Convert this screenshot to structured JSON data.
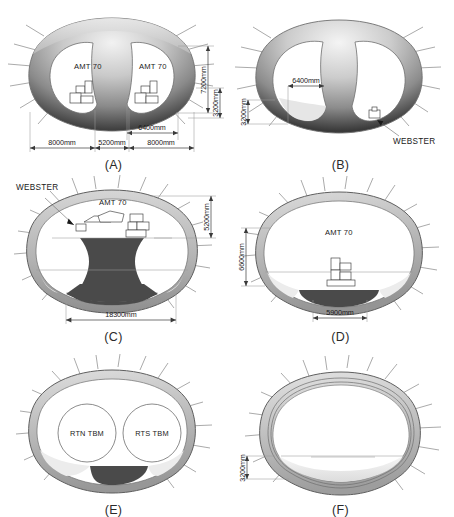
{
  "figure": {
    "title": "",
    "type": "engineering-diagram",
    "panel_count": 6
  },
  "colors": {
    "dark_fill": "#4a4a4a",
    "mid_gray": "#8f8f8f",
    "light_gray": "#d8d8d8",
    "pale_gray": "#efefef",
    "outline": "#6f6f6f",
    "dim_line": "#3a3a3a",
    "text": "#1a1a1a",
    "bolt": "#8d8d8d",
    "white": "#ffffff"
  },
  "panels": [
    {
      "id": "A",
      "label": "(A)",
      "equipment": [
        {
          "name": "AMT 70",
          "side": "left"
        },
        {
          "name": "AMT 70",
          "side": "right"
        }
      ],
      "dimensions": [
        {
          "value": "8000mm",
          "orientation": "horizontal",
          "position": "bottom-left"
        },
        {
          "value": "5200mm",
          "orientation": "horizontal",
          "position": "bottom-center"
        },
        {
          "value": "8000mm",
          "orientation": "horizontal",
          "position": "bottom-right"
        },
        {
          "value": "6400mm",
          "orientation": "horizontal",
          "position": "bottom-right-upper"
        },
        {
          "value": "7200mm",
          "orientation": "vertical",
          "position": "right"
        },
        {
          "value": "3200mm",
          "orientation": "vertical",
          "position": "far-right"
        }
      ],
      "callouts": []
    },
    {
      "id": "B",
      "label": "(B)",
      "equipment": [],
      "dimensions": [
        {
          "value": "6400mm",
          "orientation": "horizontal",
          "position": "left-drift"
        },
        {
          "value": "3200mm",
          "orientation": "vertical",
          "position": "left"
        }
      ],
      "callouts": [
        {
          "text": "WEBSTER",
          "position": "bottom-right"
        }
      ]
    },
    {
      "id": "C",
      "label": "(C)",
      "equipment": [
        {
          "name": "AMT 70",
          "side": "crown"
        }
      ],
      "dimensions": [
        {
          "value": "18300mm",
          "orientation": "horizontal",
          "position": "bottom"
        },
        {
          "value": "5200mm",
          "orientation": "vertical",
          "position": "right"
        }
      ],
      "callouts": [
        {
          "text": "WEBSTER",
          "position": "top-left"
        }
      ]
    },
    {
      "id": "D",
      "label": "(D)",
      "equipment": [
        {
          "name": "AMT 70",
          "side": "center"
        }
      ],
      "dimensions": [
        {
          "value": "6600mm",
          "orientation": "vertical",
          "position": "left"
        },
        {
          "value": "5900mm",
          "orientation": "horizontal",
          "position": "bottom"
        }
      ],
      "callouts": []
    },
    {
      "id": "E",
      "label": "(E)",
      "equipment": [
        {
          "name": "RTN TBM",
          "side": "left"
        },
        {
          "name": "RTS TBM",
          "side": "right"
        }
      ],
      "dimensions": [],
      "callouts": []
    },
    {
      "id": "F",
      "label": "(F)",
      "equipment": [],
      "dimensions": [
        {
          "value": "3200mm",
          "orientation": "vertical",
          "position": "left"
        }
      ],
      "callouts": []
    }
  ]
}
